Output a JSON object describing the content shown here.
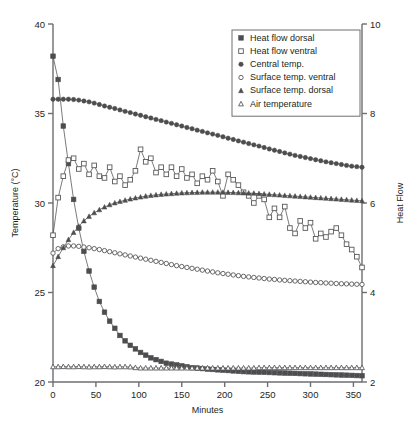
{
  "chart_data": {
    "type": "line",
    "title": "",
    "xlabel": "Minutes",
    "ylabel": "Temperature (°C)",
    "y2label": "Heat Flow",
    "xlim": [
      0,
      360
    ],
    "ylim": [
      20,
      40
    ],
    "y2lim": [
      2,
      10
    ],
    "xticks": [
      0,
      50,
      100,
      150,
      200,
      250,
      300,
      350
    ],
    "yticks": [
      20,
      25,
      30,
      35,
      40
    ],
    "y2ticks": [
      2,
      4,
      6,
      8,
      10
    ],
    "grid": false,
    "legend_position": "top-right",
    "series": [
      {
        "name": "Heat flow dorsal",
        "marker": "filled-square",
        "axis": "right",
        "x": [
          0,
          6,
          12,
          18,
          24,
          30,
          36,
          42,
          48,
          54,
          60,
          66,
          72,
          78,
          84,
          90,
          96,
          102,
          108,
          114,
          120,
          126,
          132,
          138,
          144,
          150,
          156,
          162,
          168,
          174,
          180,
          186,
          192,
          198,
          204,
          210,
          216,
          222,
          228,
          234,
          240,
          246,
          252,
          258,
          264,
          270,
          276,
          282,
          288,
          294,
          300,
          306,
          312,
          318,
          324,
          330,
          336,
          342,
          348,
          354,
          360
        ],
        "values": [
          38.2,
          36.9,
          34.3,
          32.2,
          30.2,
          28.6,
          27.3,
          26.2,
          25.3,
          24.5,
          23.9,
          23.4,
          23.0,
          22.6,
          22.3,
          22.05,
          21.85,
          21.65,
          21.5,
          21.35,
          21.25,
          21.15,
          21.05,
          21.0,
          20.95,
          20.9,
          20.85,
          20.8,
          20.78,
          20.75,
          20.72,
          20.7,
          20.68,
          20.66,
          20.64,
          20.62,
          20.6,
          20.58,
          20.57,
          20.56,
          20.55,
          20.54,
          20.53,
          20.52,
          20.51,
          20.5,
          20.49,
          20.48,
          20.47,
          20.46,
          20.45,
          20.44,
          20.43,
          20.42,
          20.41,
          20.4,
          20.39,
          20.38,
          20.37,
          20.36,
          20.35
        ]
      },
      {
        "name": "Heat flow ventral",
        "marker": "open-square",
        "axis": "right",
        "x": [
          0,
          6,
          12,
          18,
          24,
          30,
          36,
          42,
          48,
          54,
          60,
          66,
          72,
          78,
          84,
          90,
          96,
          102,
          108,
          114,
          120,
          126,
          132,
          138,
          144,
          150,
          156,
          162,
          168,
          174,
          180,
          186,
          192,
          198,
          204,
          210,
          216,
          222,
          228,
          234,
          240,
          246,
          252,
          258,
          264,
          270,
          276,
          282,
          288,
          294,
          300,
          306,
          312,
          318,
          324,
          330,
          336,
          342,
          348,
          354,
          360
        ],
        "values": [
          28.2,
          30.3,
          31.5,
          32.4,
          32.5,
          31.9,
          32.2,
          31.6,
          32.1,
          31.5,
          31.4,
          32.0,
          31.2,
          31.5,
          31.0,
          31.3,
          31.8,
          33.0,
          32.3,
          32.5,
          31.7,
          32.0,
          31.6,
          32.0,
          31.5,
          31.9,
          31.4,
          31.6,
          31.1,
          31.5,
          31.3,
          31.8,
          31.2,
          30.4,
          31.6,
          31.3,
          31.0,
          30.6,
          30.4,
          30.0,
          30.4,
          30.2,
          29.2,
          29.7,
          29.2,
          29.8,
          28.6,
          28.3,
          29.0,
          28.6,
          28.9,
          28.0,
          28.3,
          28.1,
          28.4,
          28.6,
          28.2,
          27.7,
          27.4,
          27.0,
          26.4
        ]
      },
      {
        "name": "Central temp.",
        "marker": "filled-circle",
        "axis": "left",
        "x": [
          0,
          6,
          12,
          18,
          24,
          30,
          36,
          42,
          48,
          54,
          60,
          66,
          72,
          78,
          84,
          90,
          96,
          102,
          108,
          114,
          120,
          126,
          132,
          138,
          144,
          150,
          156,
          162,
          168,
          174,
          180,
          186,
          192,
          198,
          204,
          210,
          216,
          222,
          228,
          234,
          240,
          246,
          252,
          258,
          264,
          270,
          276,
          282,
          288,
          294,
          300,
          306,
          312,
          318,
          324,
          330,
          336,
          342,
          348,
          354,
          360
        ],
        "values": [
          35.8,
          35.8,
          35.8,
          35.8,
          35.78,
          35.75,
          35.7,
          35.65,
          35.58,
          35.5,
          35.42,
          35.35,
          35.28,
          35.2,
          35.12,
          35.05,
          34.97,
          34.9,
          34.82,
          34.75,
          34.67,
          34.6,
          34.52,
          34.45,
          34.37,
          34.3,
          34.22,
          34.15,
          34.07,
          34.0,
          33.92,
          33.85,
          33.78,
          33.7,
          33.62,
          33.55,
          33.47,
          33.4,
          33.32,
          33.25,
          33.18,
          33.1,
          33.02,
          32.95,
          32.88,
          32.8,
          32.73,
          32.66,
          32.6,
          32.54,
          32.48,
          32.42,
          32.36,
          32.3,
          32.25,
          32.2,
          32.15,
          32.1,
          32.06,
          32.03,
          32.0
        ]
      },
      {
        "name": "Surface temp. ventral",
        "marker": "open-circle",
        "axis": "left",
        "x": [
          0,
          6,
          12,
          18,
          24,
          30,
          36,
          42,
          48,
          54,
          60,
          66,
          72,
          78,
          84,
          90,
          96,
          102,
          108,
          114,
          120,
          126,
          132,
          138,
          144,
          150,
          156,
          162,
          168,
          174,
          180,
          186,
          192,
          198,
          204,
          210,
          216,
          222,
          228,
          234,
          240,
          246,
          252,
          258,
          264,
          270,
          276,
          282,
          288,
          294,
          300,
          306,
          312,
          318,
          324,
          330,
          336,
          342,
          348,
          354,
          360
        ],
        "values": [
          27.2,
          27.45,
          27.55,
          27.6,
          27.6,
          27.58,
          27.54,
          27.5,
          27.45,
          27.4,
          27.34,
          27.28,
          27.22,
          27.16,
          27.1,
          27.04,
          26.98,
          26.92,
          26.86,
          26.8,
          26.74,
          26.68,
          26.62,
          26.56,
          26.5,
          26.45,
          26.4,
          26.35,
          26.3,
          26.25,
          26.2,
          26.15,
          26.1,
          26.06,
          26.02,
          25.98,
          25.94,
          25.9,
          25.87,
          25.84,
          25.81,
          25.78,
          25.75,
          25.73,
          25.7,
          25.68,
          25.66,
          25.64,
          25.62,
          25.6,
          25.58,
          25.56,
          25.55,
          25.53,
          25.52,
          25.5,
          25.49,
          25.48,
          25.47,
          25.46,
          25.45
        ]
      },
      {
        "name": "Surface temp. dorsal",
        "marker": "filled-triangle",
        "axis": "left",
        "x": [
          0,
          6,
          12,
          18,
          24,
          30,
          36,
          42,
          48,
          54,
          60,
          66,
          72,
          78,
          84,
          90,
          96,
          102,
          108,
          114,
          120,
          126,
          132,
          138,
          144,
          150,
          156,
          162,
          168,
          174,
          180,
          186,
          192,
          198,
          204,
          210,
          216,
          222,
          228,
          234,
          240,
          246,
          252,
          258,
          264,
          270,
          276,
          282,
          288,
          294,
          300,
          306,
          312,
          318,
          324,
          330,
          336,
          342,
          348,
          354,
          360
        ],
        "values": [
          26.5,
          27.0,
          27.5,
          27.95,
          28.35,
          28.7,
          29.0,
          29.25,
          29.45,
          29.62,
          29.77,
          29.9,
          30.0,
          30.08,
          30.15,
          30.22,
          30.28,
          30.33,
          30.38,
          30.42,
          30.45,
          30.48,
          30.5,
          30.52,
          30.54,
          30.56,
          30.57,
          30.58,
          30.59,
          30.6,
          30.6,
          30.6,
          30.6,
          30.6,
          30.59,
          30.58,
          30.57,
          30.56,
          30.55,
          30.54,
          30.52,
          30.5,
          30.48,
          30.46,
          30.44,
          30.42,
          30.4,
          30.38,
          30.36,
          30.34,
          30.32,
          30.3,
          30.28,
          30.26,
          30.24,
          30.22,
          30.2,
          30.18,
          30.16,
          30.14,
          30.12
        ]
      },
      {
        "name": "Air temperature",
        "marker": "open-triangle",
        "axis": "left",
        "x": [
          0,
          6,
          12,
          18,
          24,
          30,
          36,
          42,
          48,
          54,
          60,
          66,
          72,
          78,
          84,
          90,
          96,
          102,
          108,
          114,
          120,
          126,
          132,
          138,
          144,
          150,
          156,
          162,
          168,
          174,
          180,
          186,
          192,
          198,
          204,
          210,
          216,
          222,
          228,
          234,
          240,
          246,
          252,
          258,
          264,
          270,
          276,
          282,
          288,
          294,
          300,
          306,
          312,
          318,
          324,
          330,
          336,
          342,
          348,
          354,
          360
        ],
        "values": [
          20.85,
          20.85,
          20.86,
          20.85,
          20.85,
          20.86,
          20.85,
          20.84,
          20.85,
          20.85,
          20.86,
          20.85,
          20.84,
          20.85,
          20.85,
          20.84,
          20.8,
          20.78,
          20.78,
          20.78,
          20.78,
          20.78,
          20.78,
          20.78,
          20.78,
          20.78,
          20.78,
          20.78,
          20.78,
          20.78,
          20.78,
          20.78,
          20.78,
          20.78,
          20.78,
          20.78,
          20.78,
          20.78,
          20.78,
          20.78,
          20.8,
          20.8,
          20.8,
          20.8,
          20.8,
          20.8,
          20.8,
          20.8,
          20.8,
          20.8,
          20.8,
          20.8,
          20.8,
          20.8,
          20.8,
          20.8,
          20.8,
          20.8,
          20.8,
          20.8,
          20.8
        ]
      }
    ]
  },
  "colors": {
    "ink": "#231f20",
    "axis": "#6d6e71",
    "series_line": "#58595b",
    "marker_fill": "#4d4d4f",
    "marker_open": "#ffffff"
  }
}
